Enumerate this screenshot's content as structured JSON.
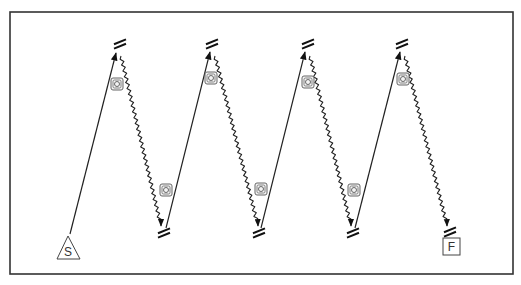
{
  "diagram": {
    "type": "drill-pattern",
    "colors": {
      "line": "#222222",
      "frame": "#333333",
      "icon_fill": "#f4f4f4",
      "icon_stroke": "#666666"
    },
    "start": {
      "label": "S",
      "shape": "triangle",
      "x": 68,
      "y": 248
    },
    "finish": {
      "label": "F",
      "shape": "square",
      "x": 451,
      "y": 246
    },
    "top_cones": [
      {
        "x": 120,
        "y": 44
      },
      {
        "x": 212,
        "y": 44
      },
      {
        "x": 308,
        "y": 44
      },
      {
        "x": 402,
        "y": 44
      }
    ],
    "bottom_cones": [
      {
        "x": 164,
        "y": 233
      },
      {
        "x": 259,
        "y": 233
      },
      {
        "x": 353,
        "y": 233
      },
      {
        "x": 450,
        "y": 232
      }
    ],
    "solid_runs": [
      {
        "from": [
          70,
          234
        ],
        "to": [
          116,
          53
        ]
      },
      {
        "from": [
          166,
          228
        ],
        "to": [
          210,
          52
        ]
      },
      {
        "from": [
          261,
          228
        ],
        "to": [
          305,
          52
        ]
      },
      {
        "from": [
          355,
          228
        ],
        "to": [
          400,
          52
        ]
      }
    ],
    "wavy_runs": [
      {
        "from": [
          121,
          56
        ],
        "to": [
          161,
          226
        ]
      },
      {
        "from": [
          215,
          56
        ],
        "to": [
          258,
          226
        ]
      },
      {
        "from": [
          310,
          56
        ],
        "to": [
          351,
          226
        ]
      },
      {
        "from": [
          405,
          56
        ],
        "to": [
          447,
          226
        ]
      }
    ],
    "icons": [
      {
        "name": "camera-icon",
        "x": 117,
        "y": 84
      },
      {
        "name": "camera-icon",
        "x": 211,
        "y": 78
      },
      {
        "name": "camera-icon",
        "x": 308,
        "y": 82
      },
      {
        "name": "camera-icon",
        "x": 403,
        "y": 79
      },
      {
        "name": "camera-icon",
        "x": 166,
        "y": 190
      },
      {
        "name": "camera-icon",
        "x": 261,
        "y": 189
      },
      {
        "name": "camera-icon",
        "x": 354,
        "y": 190
      }
    ]
  }
}
